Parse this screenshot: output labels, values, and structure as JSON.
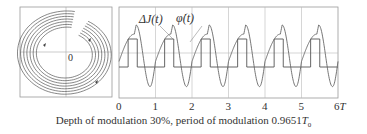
{
  "figure": {
    "caption_prefix": "Depth of modulation 30%, period of modulation 0.9651",
    "caption_symbol": "T",
    "caption_sub": "0"
  },
  "chart_data": [
    {
      "type": "line",
      "title": "Phase portrait (spiral trajectory)",
      "center_label": "0",
      "grid": true,
      "description": "Multiple nested clockwise-spiraling loops with arrows, kinked at upper right and lower left",
      "loops": 7,
      "arrows": [
        "upper-left",
        "upper-right",
        "lower-right"
      ]
    },
    {
      "type": "line",
      "xlabel": "T",
      "x_ticks": [
        "0",
        "1",
        "2",
        "3",
        "4",
        "5",
        "6T"
      ],
      "xlim": [
        0,
        6
      ],
      "grid": true,
      "legend": [
        "ΔJ(t)",
        "φ̇(t)"
      ],
      "series": [
        {
          "name": "ΔJ(t)",
          "shape": "square wave",
          "levels": [
            1,
            -1
          ],
          "duty": "high from ~0.25 to ~0.5 of each period, low from ~0.5 to ~1",
          "x_transitions": [
            0.25,
            0.5,
            1.0,
            1.25,
            1.5,
            2.0,
            2.25,
            2.5,
            3.0,
            3.25,
            3.5,
            4.0,
            4.25,
            4.5,
            5.0,
            5.25,
            5.5,
            6.0
          ]
        },
        {
          "name": "φ̇(t)",
          "shape": "distorted sine with spike before drop",
          "peak": 1.35,
          "spike": 2.0,
          "trough": -2.4,
          "period": 1
        }
      ]
    }
  ]
}
